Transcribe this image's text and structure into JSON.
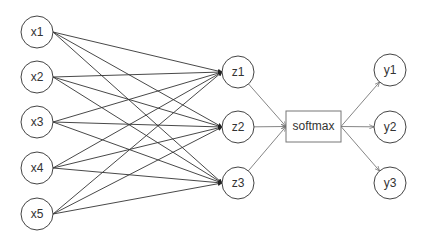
{
  "diagram": {
    "inputs": [
      {
        "label": "x1",
        "cx": 37,
        "cy": 32
      },
      {
        "label": "x2",
        "cx": 37,
        "cy": 77
      },
      {
        "label": "x3",
        "cx": 37,
        "cy": 122
      },
      {
        "label": "x4",
        "cx": 37,
        "cy": 168
      },
      {
        "label": "x5",
        "cx": 37,
        "cy": 214
      }
    ],
    "hidden": [
      {
        "label": "z1",
        "cx": 238,
        "cy": 72
      },
      {
        "label": "z2",
        "cx": 238,
        "cy": 127
      },
      {
        "label": "z3",
        "cx": 238,
        "cy": 183
      }
    ],
    "softmax": {
      "label": "softmax",
      "x": 286,
      "y": 111,
      "w": 55,
      "h": 31
    },
    "outputs": [
      {
        "label": "y1",
        "cx": 390,
        "cy": 70
      },
      {
        "label": "y2",
        "cx": 390,
        "cy": 127
      },
      {
        "label": "y3",
        "cx": 390,
        "cy": 183
      }
    ],
    "node_radius": 16,
    "stroke_color": "#555555"
  }
}
